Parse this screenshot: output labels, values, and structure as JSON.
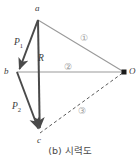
{
  "figure": {
    "caption": "(b) 시력도",
    "caption_prefix": "(b)",
    "caption_title": "시력도",
    "background_color": "#ffffff",
    "points": [
      {
        "id": "a",
        "label": "a",
        "x": 38,
        "y": 20,
        "label_x": 35,
        "label_y": 4,
        "marker": "none"
      },
      {
        "id": "b",
        "label": "b",
        "x": 17,
        "y": 72,
        "label_x": 4,
        "label_y": 67,
        "marker": "none"
      },
      {
        "id": "c",
        "label": "c",
        "x": 40,
        "y": 133,
        "label_x": 37,
        "label_y": 136,
        "marker": "none"
      },
      {
        "id": "O",
        "label": "O",
        "x": 124,
        "y": 72,
        "label_x": 129,
        "label_y": 67,
        "marker": "dot"
      }
    ],
    "vectors": [
      {
        "id": "P1",
        "label": "P",
        "sub": "1",
        "from": "a",
        "to": "b",
        "label_x": 14,
        "label_y": 38,
        "style": "solid-arrow",
        "color": "#4a4a4a"
      },
      {
        "id": "R",
        "label": "R",
        "sub": "",
        "from": "a",
        "to": "c",
        "label_x": 38,
        "label_y": 54,
        "style": "solid-arrow",
        "color": "#4a4a4a"
      },
      {
        "id": "P2",
        "label": "P",
        "sub": "2",
        "from": "b",
        "to": "c",
        "label_x": 12,
        "label_y": 102,
        "style": "solid-arrow",
        "color": "#4a4a4a"
      }
    ],
    "rays": [
      {
        "id": "ray1",
        "circled_label": "①",
        "from": "a",
        "to": "O",
        "label_x": 80,
        "label_y": 34,
        "style": "solid",
        "color": "#9a9a9a"
      },
      {
        "id": "ray2",
        "circled_label": "②",
        "from": "b",
        "to": "O",
        "label_x": 64,
        "label_y": 63,
        "style": "solid",
        "color": "#9a9a9a"
      },
      {
        "id": "ray3",
        "circled_label": "③",
        "from": "c",
        "to": "O",
        "label_x": 78,
        "label_y": 107,
        "style": "dashed",
        "color": "#6a6a6a"
      }
    ],
    "colors": {
      "vector_stroke": "#4a4a4a",
      "ray_stroke": "#9a9a9a",
      "dashed_stroke": "#5a5a5a",
      "circled_label": "#9a9a9a",
      "point_label": "#3a3a3a",
      "caption": "#4a4a4a"
    }
  }
}
